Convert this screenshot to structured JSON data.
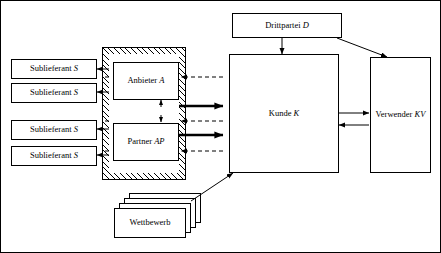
{
  "diagram": {
    "nodes": {
      "sublieferant_1": "Sublieferant S",
      "sublieferant_2": "Sublieferant S",
      "sublieferant_3": "Sublieferant S",
      "sublieferant_4": "Sublieferant S",
      "anbieter": "Anbieter A",
      "partner": "Partner AP",
      "kunde": "Kunde K",
      "drittpartei": "Drittpartei D",
      "verwender": "Verwender KV",
      "wettbewerb": "Wettbewerb"
    },
    "colors": {
      "line": "#000000",
      "background": "#ffffff",
      "hatch": "#000000"
    }
  }
}
